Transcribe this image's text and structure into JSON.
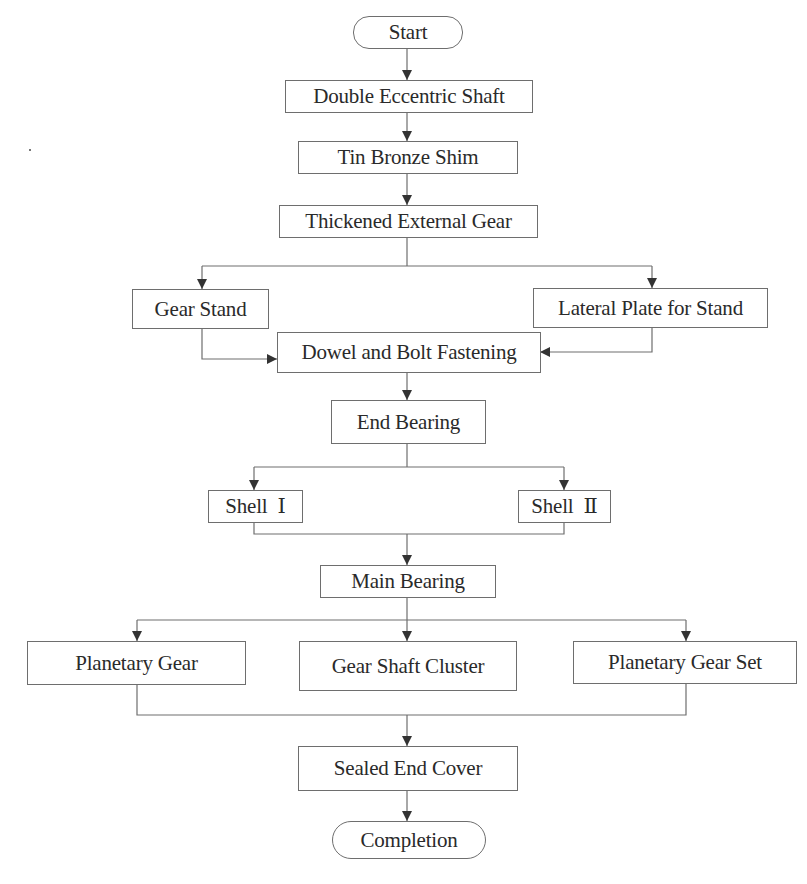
{
  "diagram": {
    "type": "flowchart",
    "direction": "top-to-bottom",
    "line_color": "#6e6e6e",
    "arrow_color": "#333333",
    "nodes": {
      "start": {
        "label": "Start",
        "shape": "terminator"
      },
      "double_eccentric_shaft": {
        "label": "Double Eccentric Shaft",
        "shape": "process"
      },
      "tin_bronze_shim": {
        "label": "Tin Bronze Shim",
        "shape": "process"
      },
      "thickened_external_gear": {
        "label": "Thickened External Gear",
        "shape": "process"
      },
      "gear_stand": {
        "label": "Gear Stand",
        "shape": "process"
      },
      "lateral_plate": {
        "label": "Lateral Plate for Stand",
        "shape": "process"
      },
      "dowel_bolt": {
        "label": "Dowel and Bolt Fastening",
        "shape": "process"
      },
      "end_bearing": {
        "label": "End Bearing",
        "shape": "process"
      },
      "shell_1": {
        "label": "Shell  Ⅰ",
        "shape": "process"
      },
      "shell_2": {
        "label": "Shell  Ⅱ",
        "shape": "process"
      },
      "main_bearing": {
        "label": "Main Bearing",
        "shape": "process"
      },
      "planetary_gear": {
        "label": "Planetary Gear",
        "shape": "process"
      },
      "gear_shaft_cluster": {
        "label": "Gear Shaft Cluster",
        "shape": "process"
      },
      "planetary_gear_set": {
        "label": "Planetary Gear Set",
        "shape": "process"
      },
      "sealed_end_cover": {
        "label": "Sealed End Cover",
        "shape": "process"
      },
      "completion": {
        "label": "Completion",
        "shape": "terminator"
      }
    },
    "edges": [
      [
        "start",
        "double_eccentric_shaft"
      ],
      [
        "double_eccentric_shaft",
        "tin_bronze_shim"
      ],
      [
        "tin_bronze_shim",
        "thickened_external_gear"
      ],
      [
        "thickened_external_gear",
        "gear_stand"
      ],
      [
        "thickened_external_gear",
        "lateral_plate"
      ],
      [
        "gear_stand",
        "dowel_bolt"
      ],
      [
        "lateral_plate",
        "dowel_bolt"
      ],
      [
        "dowel_bolt",
        "end_bearing"
      ],
      [
        "end_bearing",
        "shell_1"
      ],
      [
        "end_bearing",
        "shell_2"
      ],
      [
        "shell_1",
        "main_bearing"
      ],
      [
        "shell_2",
        "main_bearing"
      ],
      [
        "main_bearing",
        "planetary_gear"
      ],
      [
        "main_bearing",
        "gear_shaft_cluster"
      ],
      [
        "main_bearing",
        "planetary_gear_set"
      ],
      [
        "planetary_gear",
        "sealed_end_cover"
      ],
      [
        "planetary_gear_set",
        "sealed_end_cover"
      ],
      [
        "sealed_end_cover",
        "completion"
      ]
    ]
  }
}
